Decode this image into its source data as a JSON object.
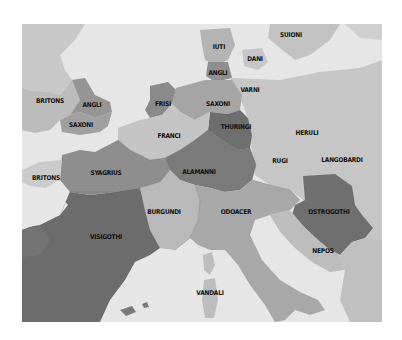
{
  "map": {
    "type": "historical-political-map",
    "region": "Western and Central Europe",
    "colors": {
      "sea": "#e6e6e6",
      "land_light": "#cfcfcf",
      "land_mid": "#a9a9a9",
      "land_dark": "#7f7f7f",
      "land_darkest": "#666666",
      "border": "#555555"
    },
    "labels": [
      {
        "id": "suioni",
        "text": "SUIONI",
        "x": 291,
        "y": 35
      },
      {
        "id": "iuti",
        "text": "IUTI",
        "x": 219,
        "y": 47
      },
      {
        "id": "dani",
        "text": "DANI",
        "x": 255,
        "y": 59
      },
      {
        "id": "angli-north",
        "text": "ANGLI",
        "x": 218,
        "y": 73
      },
      {
        "id": "varni",
        "text": "VARNI",
        "x": 250,
        "y": 90
      },
      {
        "id": "britons-north",
        "text": "BRITONS",
        "x": 50,
        "y": 101
      },
      {
        "id": "angli-britain",
        "text": "ANGLI",
        "x": 92,
        "y": 105
      },
      {
        "id": "frisi",
        "text": "FRISI",
        "x": 163,
        "y": 104
      },
      {
        "id": "saxoni-continent",
        "text": "SAXONI",
        "x": 218,
        "y": 104
      },
      {
        "id": "saxoni-britain",
        "text": "SAXONI",
        "x": 81,
        "y": 125
      },
      {
        "id": "thuringi",
        "text": "THURINGI",
        "x": 236,
        "y": 127
      },
      {
        "id": "heruli",
        "text": "HERULI",
        "x": 307,
        "y": 133
      },
      {
        "id": "franci",
        "text": "FRANCI",
        "x": 169,
        "y": 136
      },
      {
        "id": "rugi",
        "text": "RUGI",
        "x": 280,
        "y": 161
      },
      {
        "id": "langobardi",
        "text": "LANGOBARDI",
        "x": 342,
        "y": 160
      },
      {
        "id": "britons-brittany",
        "text": "BRITONS",
        "x": 46,
        "y": 178
      },
      {
        "id": "syagrius",
        "text": "SYAGRIUS",
        "x": 106,
        "y": 173
      },
      {
        "id": "alamanni",
        "text": "ALAMANNI",
        "x": 199,
        "y": 172
      },
      {
        "id": "burgundi",
        "text": "BURGUNDI",
        "x": 164,
        "y": 212
      },
      {
        "id": "odoacer",
        "text": "ODOACER",
        "x": 236,
        "y": 212
      },
      {
        "id": "ostrogothi",
        "text": "OSTROGOTHI",
        "x": 329,
        "y": 212
      },
      {
        "id": "visigothi",
        "text": "VISIGOTHI",
        "x": 106,
        "y": 237
      },
      {
        "id": "nepos",
        "text": "NEPOS",
        "x": 323,
        "y": 251
      },
      {
        "id": "vandali",
        "text": "VANDALI",
        "x": 210,
        "y": 293
      }
    ]
  }
}
